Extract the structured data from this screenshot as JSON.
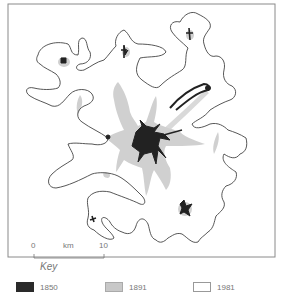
{
  "map": {
    "scale_bar": {
      "start_label": "0",
      "unit_label": "km",
      "end_label": "10"
    }
  },
  "key": {
    "title": "Key",
    "items": [
      {
        "label": "1850",
        "color": "#2a2a2a",
        "border": "#2a2a2a"
      },
      {
        "label": "1891",
        "color": "#c8c8c8",
        "border": "#aaaaaa"
      },
      {
        "label": "1981",
        "color": "#ffffff",
        "border": "#999999"
      }
    ]
  },
  "colors": {
    "frame": "#888888",
    "outline_1981": "#444444",
    "area_1891": "#cfcfcf",
    "area_1850": "#222222"
  }
}
